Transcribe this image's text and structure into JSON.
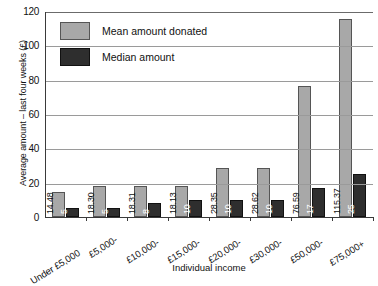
{
  "chart_data": {
    "type": "bar",
    "title": "",
    "xlabel": "Individual income",
    "ylabel": "Average amount – last four weeks (£)",
    "ylim": [
      0,
      120
    ],
    "yticks": [
      0,
      20,
      40,
      60,
      80,
      100,
      120
    ],
    "grid": true,
    "legend_position": "top-left",
    "categories": [
      "Under £5,000",
      "£5,000-",
      "£10,000-",
      "£15,000-",
      "£20,000-",
      "£30,000-",
      "£50,000-",
      "£75,000+"
    ],
    "series": [
      {
        "name": "Mean amount donated",
        "color": "#a8a8a8",
        "values": [
          14.48,
          18.3,
          18.31,
          18.13,
          28.35,
          28.62,
          76.59,
          115.37
        ],
        "labels": [
          "14.48",
          "18.30",
          "18.31",
          "18.13",
          "28.35",
          "28.62",
          "76.59",
          "115.37"
        ]
      },
      {
        "name": "Median amount",
        "color": "#2e2e2e",
        "values": [
          5,
          5,
          8,
          10,
          10,
          10,
          17,
          25
        ],
        "labels": [
          "5",
          "5",
          "8",
          "10",
          "10",
          "10",
          "17",
          "25"
        ]
      }
    ]
  },
  "legend": {
    "items": [
      {
        "label": "Mean amount donated",
        "swatch": "mean"
      },
      {
        "label": "Median amount",
        "swatch": "median"
      }
    ]
  },
  "axes": {
    "y_title": "Average amount – last four weeks (£)",
    "x_title": "Individual income",
    "y_tick_labels": [
      "120",
      "100",
      "80",
      "60",
      "40",
      "20",
      "0"
    ]
  }
}
